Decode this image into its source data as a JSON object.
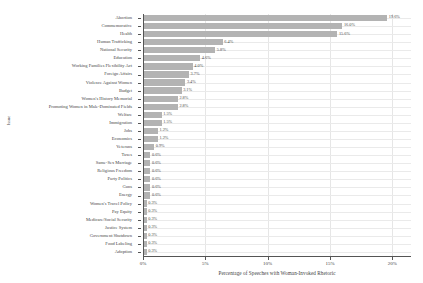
{
  "chart_data": {
    "type": "bar",
    "orientation": "horizontal",
    "title": "",
    "xlabel": "Percentage of Speeches with Woman-Invoked Rhetoric",
    "ylabel": "Issue",
    "xlim": [
      0,
      21.5
    ],
    "xticks": [
      0,
      5,
      10,
      15,
      20
    ],
    "xticklabels": [
      "0%",
      "5%",
      "10%",
      "15%",
      "20%"
    ],
    "grid": true,
    "legend": "none",
    "bar_color": "#b3b3b3",
    "categories": [
      "Abortion",
      "Commemorative",
      "Health",
      "Human Trafficking",
      "National Security",
      "Education",
      "Working Families Flexibility Act",
      "Foreign Affairs",
      "Violence Against Women",
      "Budget",
      "Women's History Memorial",
      "Promoting Women in Male-Dominated Fields",
      "Welfare",
      "Immigration",
      "Jobs",
      "Economics",
      "Veterans",
      "Taxes",
      "Same-Sex Marriage",
      "Religious Freedom",
      "Party Politics",
      "Guns",
      "Energy",
      "Women's Travel Policy",
      "Pay Equity",
      "Medicare/Social Security",
      "Justice System",
      "Government Shutdown",
      "Food Labeling",
      "Adoption"
    ],
    "values": [
      19.6,
      16.0,
      15.6,
      6.4,
      5.8,
      4.6,
      4.0,
      3.7,
      3.4,
      3.1,
      2.8,
      2.8,
      1.5,
      1.5,
      1.2,
      1.2,
      0.9,
      0.6,
      0.6,
      0.6,
      0.6,
      0.6,
      0.6,
      0.3,
      0.3,
      0.3,
      0.3,
      0.3,
      0.3,
      0.3
    ],
    "value_labels": [
      "19.6%",
      "16.0%",
      "15.6%",
      "6.4%",
      "5.8%",
      "4.6%",
      "4.0%",
      "3.7%",
      "3.4%",
      "3.1%",
      "2.8%",
      "2.8%",
      "1.5%",
      "1.5%",
      "1.2%",
      "1.2%",
      "0.9%",
      "0.6%",
      "0.6%",
      "0.6%",
      "0.6%",
      "0.6%",
      "0.6%",
      "0.3%",
      "0.3%",
      "0.3%",
      "0.3%",
      "0.3%",
      "0.3%",
      "0.3%"
    ]
  }
}
